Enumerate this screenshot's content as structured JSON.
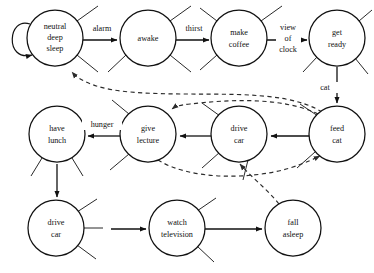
{
  "diagram": {
    "type": "state-transition-graph",
    "canvas": {
      "width": 374,
      "height": 273
    },
    "style": {
      "background": "#ffffff",
      "node_fill": "#ffffff",
      "node_stroke": "#111111",
      "solid_edge_color": "#111111",
      "dashed_edge_color": "#2b2b2b",
      "text_color": "#111111",
      "node_radius": 28
    },
    "nodes": [
      {
        "id": "neutral_deep_sleep",
        "lines": [
          "neutral",
          "deep",
          "sleep"
        ],
        "cx": 55,
        "cy": 38,
        "r": 28
      },
      {
        "id": "awake",
        "lines": [
          "awake"
        ],
        "cx": 148,
        "cy": 38,
        "r": 28
      },
      {
        "id": "make_coffee",
        "lines": [
          "make",
          "coffee"
        ],
        "cx": 239,
        "cy": 38,
        "r": 28
      },
      {
        "id": "get_ready",
        "lines": [
          "get",
          "ready"
        ],
        "cx": 337,
        "cy": 38,
        "r": 28
      },
      {
        "id": "have_lunch",
        "lines": [
          "have",
          "lunch"
        ],
        "cx": 57,
        "cy": 134,
        "r": 28
      },
      {
        "id": "give_lecture",
        "lines": [
          "give",
          "lecture"
        ],
        "cx": 148,
        "cy": 134,
        "r": 28
      },
      {
        "id": "drive_car_mid",
        "lines": [
          "drive",
          "car"
        ],
        "cx": 239,
        "cy": 134,
        "r": 28
      },
      {
        "id": "feed_cat",
        "lines": [
          "feed",
          "cat"
        ],
        "cx": 337,
        "cy": 134,
        "r": 28
      },
      {
        "id": "drive_car_bottom",
        "lines": [
          "drive",
          "car"
        ],
        "cx": 56,
        "cy": 228,
        "r": 28
      },
      {
        "id": "watch_television",
        "lines": [
          "watch",
          "television"
        ],
        "cx": 177,
        "cy": 228,
        "r": 28
      },
      {
        "id": "fall_asleep",
        "lines": [
          "fall",
          "asleep"
        ],
        "cx": 293,
        "cy": 228,
        "r": 28
      }
    ],
    "edge_labels": [
      {
        "id": "alarm",
        "lines": [
          "alarm"
        ],
        "x": 102,
        "y": 29
      },
      {
        "id": "thirst",
        "lines": [
          "thirst"
        ],
        "x": 194,
        "y": 29
      },
      {
        "id": "view_of_clock",
        "lines": [
          "view",
          "of",
          "clock"
        ],
        "x": 288,
        "y": 41
      },
      {
        "id": "cat",
        "lines": [
          "cat"
        ],
        "x": 325,
        "y": 88
      },
      {
        "id": "hunger",
        "lines": [
          "hunger"
        ],
        "x": 102,
        "y": 125
      }
    ],
    "transitions": [
      {
        "from": "neutral_deep_sleep",
        "to": "neutral_deep_sleep",
        "label": "",
        "style": "solid",
        "kind": "self-loop"
      },
      {
        "from": "neutral_deep_sleep",
        "to": "awake",
        "label": "alarm",
        "style": "solid"
      },
      {
        "from": "awake",
        "to": "make_coffee",
        "label": "thirst",
        "style": "solid"
      },
      {
        "from": "make_coffee",
        "to": "get_ready",
        "label": "view of clock",
        "style": "solid"
      },
      {
        "from": "get_ready",
        "to": "feed_cat",
        "label": "cat",
        "style": "solid"
      },
      {
        "from": "feed_cat",
        "to": "drive_car_mid",
        "label": "",
        "style": "solid"
      },
      {
        "from": "drive_car_mid",
        "to": "give_lecture",
        "label": "",
        "style": "solid"
      },
      {
        "from": "give_lecture",
        "to": "have_lunch",
        "label": "hunger",
        "style": "solid"
      },
      {
        "from": "have_lunch",
        "to": "drive_car_bottom",
        "label": "",
        "style": "solid"
      },
      {
        "from": "drive_car_bottom",
        "to": "watch_television",
        "label": "",
        "style": "solid"
      },
      {
        "from": "watch_television",
        "to": "fall_asleep",
        "label": "",
        "style": "solid"
      },
      {
        "from": "feed_cat",
        "to": "neutral_deep_sleep",
        "label": "",
        "style": "dashed"
      },
      {
        "from": "feed_cat",
        "to": "give_lecture",
        "label": "",
        "style": "dashed"
      },
      {
        "from": "give_lecture",
        "to": "feed_cat",
        "label": "",
        "style": "dashed"
      },
      {
        "from": "fall_asleep",
        "to": "drive_car_mid",
        "label": "",
        "style": "dashed"
      }
    ]
  }
}
